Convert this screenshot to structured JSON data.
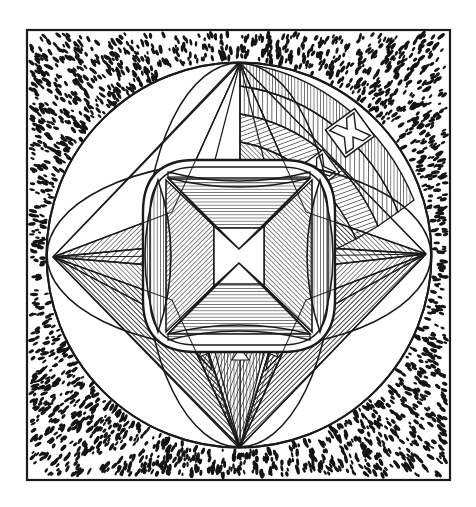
{
  "figure": {
    "title": "Four-pointed star rosette inscribed in a circle",
    "medium": "line engraving",
    "caption": "",
    "ink_color": "#1a1a1a",
    "paper_color": "#ffffff",
    "hatch_color": "#2a2a2a",
    "stipple_color": "#141414",
    "canvas": {
      "width": 476,
      "height": 507
    }
  },
  "frame": {
    "name": "square border",
    "x": 27,
    "y": 30,
    "width": 423,
    "height": 450,
    "stroke_width": 2.2
  },
  "circle": {
    "name": "great circle",
    "cx": 239,
    "cy": 255,
    "r": 193,
    "stroke_width": 2.0
  },
  "background": {
    "name": "stipple field",
    "description": "dense stippled dots filling the square between the border and the circle",
    "dot_count": 2100
  },
  "star": {
    "name": "four-pointed star",
    "points": [
      {
        "label": "north apex",
        "x": 240,
        "y": 62
      },
      {
        "label": "east apex",
        "x": 426,
        "y": 254
      },
      {
        "label": "south apex",
        "x": 240,
        "y": 448
      },
      {
        "label": "west apex",
        "x": 53,
        "y": 257
      }
    ],
    "shading": {
      "north_point": "unshaded white facets",
      "east_point": "diagonal hatching",
      "south_point": "diagonal hatching",
      "west_point": "diagonal hatching"
    }
  },
  "center": {
    "name": "central rounded-square boss",
    "cx": 239,
    "cy": 256,
    "half_size": 96,
    "corner_radius": 44,
    "motif": "white saltire cross formed by four hatched triangular facets",
    "lenses": [
      {
        "label": "left vertical lens",
        "cx": 158,
        "cy": 256
      },
      {
        "label": "right vertical lens",
        "cx": 320,
        "cy": 256
      }
    ]
  },
  "checker_panels": [
    {
      "label": "upper outer cross panel",
      "cx": 350,
      "cy": 133,
      "size": 34,
      "rotation": -36
    },
    {
      "label": "lower inner cross panel",
      "cx": 320,
      "cy": 169,
      "size": 28,
      "rotation": -36
    }
  ],
  "teeth": {
    "name": "saw-tooth crenellation",
    "description": "small white triangular teeth lining the inner edges of each star point",
    "count_per_point": 3
  }
}
